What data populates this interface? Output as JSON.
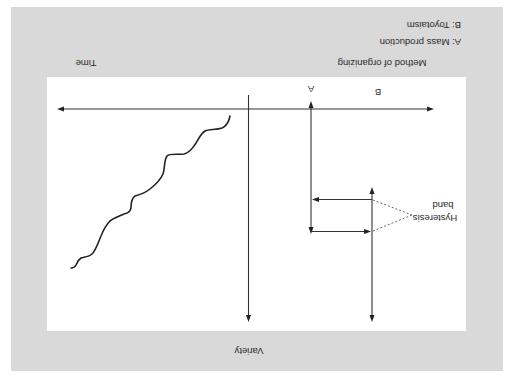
{
  "figure": {
    "orientation": "rotated-180",
    "colors": {
      "panel_bg": "#d9d9d9",
      "plot_bg": "#ffffff",
      "line": "#333333",
      "text": "#2a2a2a"
    },
    "axes": {
      "x_label": "Time",
      "y_label": "Variety",
      "y2_label": "Method of organizing"
    },
    "legend": [
      {
        "key": "A",
        "text": "A:  Mass production"
      },
      {
        "key": "B",
        "text": "B:  Toyotaism"
      }
    ],
    "markers": {
      "a_label": "A",
      "b_label": "B"
    },
    "annotation": {
      "line1": "Hysteresis",
      "line2": "band"
    },
    "curve_description": "Stepwise rising variety over time"
  }
}
